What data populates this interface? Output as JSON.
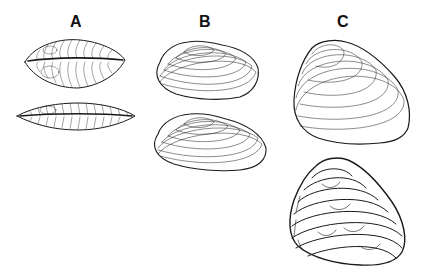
{
  "figure": {
    "panels": [
      {
        "id": "A",
        "label": "A",
        "description": "Bivalve shell, dorsal/ventral views (elongate lenticular)",
        "views": 2
      },
      {
        "id": "B",
        "label": "B",
        "description": "Bivalve shell, lateral views (ovate, concentric growth lines)",
        "views": 2
      },
      {
        "id": "C",
        "label": "C",
        "description": "Bivalve shell, lateral views (trigonal; smooth and coarsely ridged forms)",
        "views": 2
      }
    ],
    "colors": {
      "ink": "#1a1a1a",
      "background": "#ffffff"
    }
  }
}
